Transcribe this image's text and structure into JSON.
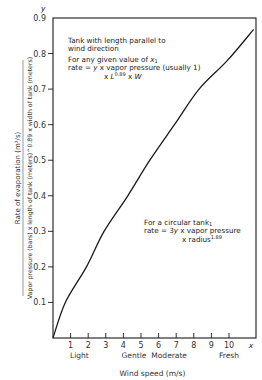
{
  "chart_data": {
    "type": "line",
    "title": "",
    "xlabel": "Wind speed (m/s)",
    "ylabel_numerator": "Rate of evaporation (m³/s)",
    "ylabel_denominator": "Vapor pressure (bars) x length of tank (meters)^0.89 x width of tank (meters)",
    "x_axis_symbol": "x",
    "y_axis_symbol": "y",
    "xlim": [
      0,
      12
    ],
    "ylim": [
      0,
      0.9
    ],
    "x_ticks": [
      1,
      2,
      3,
      4,
      5,
      6,
      7,
      8,
      9,
      10
    ],
    "y_ticks": [
      0.1,
      0.2,
      0.3,
      0.4,
      0.5,
      0.6,
      0.7,
      0.8,
      0.9
    ],
    "y_tick_labels": [
      "0.1",
      "0.2",
      "0.3",
      "0.4",
      "0.5",
      "0.6",
      "0.7",
      "0.8",
      "0.9"
    ],
    "wind_categories": [
      {
        "label": "Light",
        "x": 1.5
      },
      {
        "label": "Gentle",
        "x": 4.6
      },
      {
        "label": "Moderate",
        "x": 6.6
      },
      {
        "label": "Fresh",
        "x": 10
      }
    ],
    "grid": false,
    "legend": null,
    "series": [
      {
        "name": "y vs wind speed",
        "x": [
          0,
          0.7,
          1.9,
          2.9,
          4.25,
          5.5,
          6.9,
          8.3,
          9.9,
          11.4
        ],
        "y": [
          0,
          0.1,
          0.2,
          0.3,
          0.4,
          0.5,
          0.6,
          0.7,
          0.78,
          0.868
        ]
      }
    ],
    "annotations": {
      "tank_parallel": {
        "line1": "Tank with length parallel to",
        "line2": "wind direction",
        "line3_prefix": "For any given value of ",
        "line3_var": "x",
        "line3_sub": "1",
        "line4_prefix": "rate = ",
        "line4_var": "y",
        "line4_suffix": " x vapor pressure (usually 1)",
        "line5_prefix": "x ",
        "line5_var": "L",
        "line5_exp": "0.89",
        "line5_mid": " x ",
        "line5_var2": "W"
      },
      "circular_tank": {
        "line1_prefix": "For a circular tank",
        "line1_sub": "1",
        "line2_prefix": "rate = 3",
        "line2_var": "y",
        "line2_suffix": " x vapor pressure",
        "line3_prefix": "x radius",
        "line3_exp": "1.89"
      }
    }
  },
  "colors": {
    "ink": "#1a1a1a",
    "axis": "#333333",
    "background": "#ffffff"
  }
}
